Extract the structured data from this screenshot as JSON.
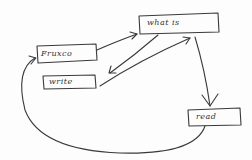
{
  "diagram": {
    "type": "hand-drawn flowchart",
    "stroke_color": "#3a3a3a",
    "nodes": [
      {
        "id": "focus",
        "label": "Fruxco"
      },
      {
        "id": "what_is",
        "label": "what   is"
      },
      {
        "id": "write",
        "label": "write"
      },
      {
        "id": "read",
        "label": "read"
      }
    ],
    "edges": [
      {
        "from": "focus",
        "to": "what_is"
      },
      {
        "from": "what_is",
        "to": "write"
      },
      {
        "from": "write",
        "to": "what_is"
      },
      {
        "from": "what_is",
        "to": "read"
      },
      {
        "from": "read",
        "to": "focus"
      }
    ]
  }
}
